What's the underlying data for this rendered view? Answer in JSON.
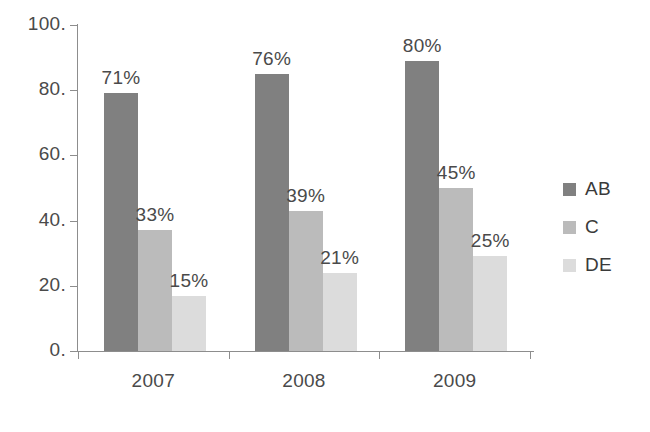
{
  "chart_data": {
    "type": "bar",
    "title": "",
    "subtitle": "",
    "xlabel": "",
    "ylabel": "",
    "categories": [
      "2007",
      "2008",
      "2009"
    ],
    "series": [
      {
        "name": "AB",
        "color": "#808080",
        "values": [
          79,
          85,
          89
        ],
        "labels": [
          "71%",
          "76%",
          "80%"
        ]
      },
      {
        "name": "C",
        "color": "#bbbbbb",
        "values": [
          37,
          43,
          50
        ],
        "labels": [
          "33%",
          "39%",
          "45%"
        ]
      },
      {
        "name": "DE",
        "color": "#dcdcdc",
        "values": [
          17,
          24,
          29
        ],
        "labels": [
          "15%",
          "21%",
          "25%"
        ]
      }
    ],
    "ylim": [
      0,
      100
    ],
    "ytick_values": [
      0,
      20,
      40,
      60,
      80,
      100
    ],
    "ytick_labels": [
      "0.",
      "20.",
      "40.",
      "60.",
      "80.",
      "100."
    ],
    "xtick_labels": [
      "2007",
      "2008",
      "2009"
    ],
    "grid": false,
    "legend_position": "right",
    "legend_entries": [
      "AB",
      "C",
      "DE"
    ],
    "bar_value_labels_shown": true
  },
  "axes": {
    "y_axis_name": "value-axis",
    "x_axis_name": "year-axis"
  }
}
